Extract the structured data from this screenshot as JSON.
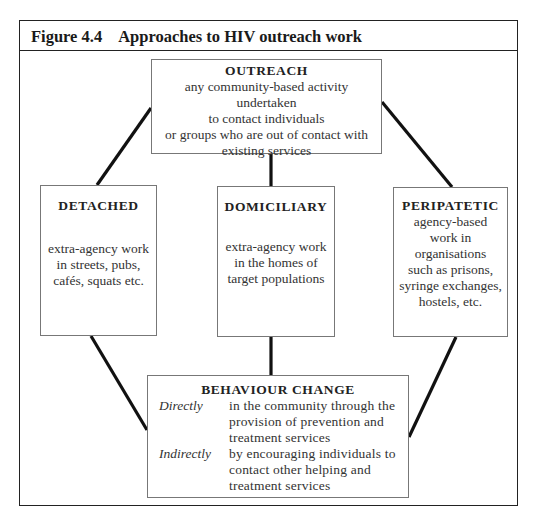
{
  "figure": {
    "number": "Figure 4.4",
    "title": "Approaches to HIV outreach work"
  },
  "nodes": {
    "outreach": {
      "heading": "OUTREACH",
      "lines": [
        "any community-based activity",
        "undertaken",
        "to contact individuals",
        "or groups who are out of contact with",
        "existing services"
      ]
    },
    "detached": {
      "heading": "DETACHED",
      "lines": [
        "extra-agency work",
        "in streets, pubs,",
        "cafés, squats etc."
      ]
    },
    "domiciliary": {
      "heading": "DOMICILIARY",
      "lines": [
        "extra-agency work",
        "in the homes of",
        "target populations"
      ]
    },
    "peripatetic": {
      "heading": "PERIPATETIC",
      "lines": [
        "agency-based",
        "work in",
        "organisations",
        "such as prisons,",
        "syringe exchanges,",
        "hostels, etc."
      ]
    },
    "behaviour_change": {
      "heading": "BEHAVIOUR CHANGE",
      "rows": [
        {
          "label": "Directly",
          "lines": [
            "in the community through the",
            "provision of prevention and",
            "treatment services"
          ]
        },
        {
          "label": "Indirectly",
          "lines": [
            "by encouraging individuals to",
            "contact other helping and",
            "treatment services"
          ]
        }
      ]
    }
  },
  "edges": [
    {
      "from": "outreach",
      "to": "detached"
    },
    {
      "from": "outreach",
      "to": "domiciliary"
    },
    {
      "from": "outreach",
      "to": "peripatetic"
    },
    {
      "from": "detached",
      "to": "behaviour_change"
    },
    {
      "from": "domiciliary",
      "to": "behaviour_change"
    },
    {
      "from": "peripatetic",
      "to": "behaviour_change"
    }
  ]
}
